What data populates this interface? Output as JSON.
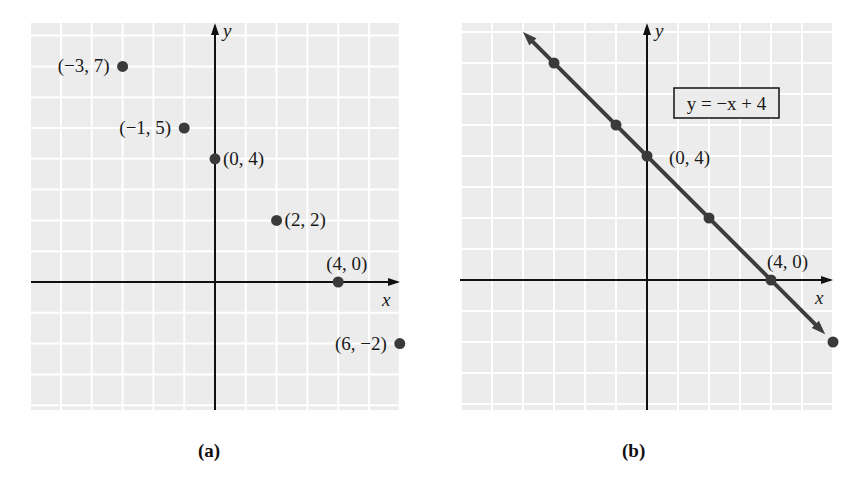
{
  "figure": {
    "panels": [
      {
        "id": "a",
        "caption": "(a)"
      },
      {
        "id": "b",
        "caption": "(b)"
      }
    ]
  },
  "colors": {
    "grid_bg": "#ececec",
    "grid_line": "#ffffff",
    "axis": "#111111",
    "point": "#3a3a3a",
    "line": "#3d3d3d",
    "text": "#1a1a1a"
  },
  "chart_data": [
    {
      "type": "scatter",
      "panel": "(a)",
      "title": "",
      "xlabel": "x",
      "ylabel": "y",
      "grid": true,
      "xlim": [
        -6,
        6
      ],
      "ylim": [
        -4,
        8
      ],
      "points": [
        {
          "x": -3,
          "y": 7,
          "label": "(−3, 7)"
        },
        {
          "x": -1,
          "y": 5,
          "label": "(−1, 5)"
        },
        {
          "x": 0,
          "y": 4,
          "label": "(0, 4)"
        },
        {
          "x": 2,
          "y": 2,
          "label": "(2, 2)"
        },
        {
          "x": 4,
          "y": 0,
          "label": "(4, 0)"
        },
        {
          "x": 6,
          "y": -2,
          "label": "(6, −2)"
        }
      ]
    },
    {
      "type": "line",
      "panel": "(b)",
      "title": "",
      "xlabel": "x",
      "ylabel": "y",
      "grid": true,
      "xlim": [
        -6,
        6
      ],
      "ylim": [
        -4,
        8
      ],
      "equation_label": "y = −x + 4",
      "series": [
        {
          "name": "y = −x + 4",
          "x": [
            -3,
            -1,
            0,
            2,
            4,
            6
          ],
          "y": [
            7,
            5,
            4,
            2,
            0,
            -2
          ]
        }
      ],
      "annotations": [
        {
          "x": 0,
          "y": 4,
          "label": "(0, 4)"
        },
        {
          "x": 4,
          "y": 0,
          "label": "(4, 0)"
        }
      ]
    }
  ]
}
